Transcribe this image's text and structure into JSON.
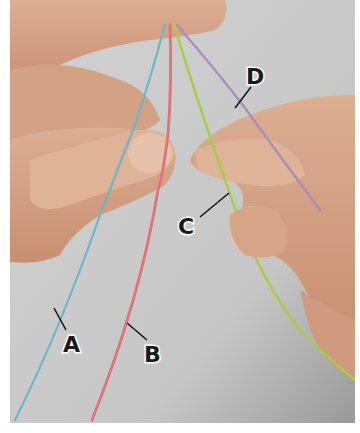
{
  "figure": {
    "background_color": "#c9c9c9",
    "skin_color": "#d9a88a",
    "threads": [
      {
        "id": "A",
        "label": "A",
        "color": "#6fb5c7"
      },
      {
        "id": "B",
        "label": "B",
        "color": "#e0727a"
      },
      {
        "id": "C",
        "label": "C",
        "color": "#a8cc45"
      },
      {
        "id": "D",
        "label": "D",
        "color": "#a98bbd"
      }
    ]
  }
}
